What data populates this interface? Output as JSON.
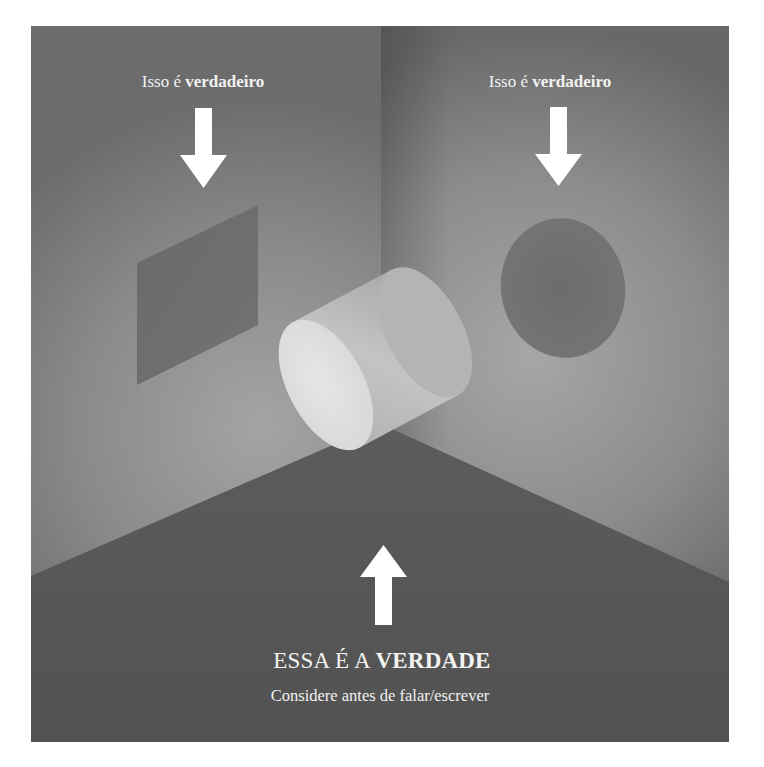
{
  "scene": {
    "colors": {
      "frame_border": "#ffffff",
      "left_wall_dark": "#6a6a6a",
      "left_wall_light": "#9a9a9a",
      "right_wall_dark": "#606060",
      "right_wall_light": "#9c9c9c",
      "floor": "#555555",
      "floor_edge": "#5d5d5d",
      "square_shadow": "#6e6e6e",
      "circle_shadow": "#707070",
      "cylinder_body": "#bdbdbd",
      "cylinder_front": "#e2e2e2",
      "text": "#f2f2f2",
      "arrow": "#ffffff"
    },
    "objects": {
      "left_projection": "square",
      "right_projection": "circle",
      "real_object": "cylinder"
    }
  },
  "labels": {
    "left": {
      "prefix": "Isso é",
      "emphasis": "verdadeiro"
    },
    "right": {
      "prefix": "Isso é",
      "emphasis": "verdadeiro"
    },
    "main": {
      "prefix": "ESSA É A",
      "emphasis": "VERDADE"
    },
    "sub": "Considere antes de falar/escrever"
  },
  "icons": {
    "left_arrow": "arrow-down-icon",
    "right_arrow": "arrow-down-icon",
    "bottom_arrow": "arrow-up-icon"
  }
}
